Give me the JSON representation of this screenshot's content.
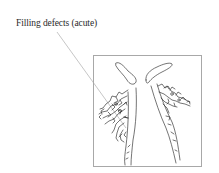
{
  "figure": {
    "annotation_label": "Filling defects (acute)",
    "colors": {
      "background": "#ffffff",
      "frame": "#a8a8a8",
      "leader_line": "#b0b0b0",
      "drawing_ink": "#3a3a3a",
      "label_text": "#2a2a2a"
    },
    "panel": {
      "description": "Line drawing of left and right renal collecting systems with filling defects",
      "structures": [
        "left-renal-pelvis-calyces",
        "right-renal-pelvis-calyces",
        "left-ureter",
        "right-ureter"
      ]
    }
  }
}
